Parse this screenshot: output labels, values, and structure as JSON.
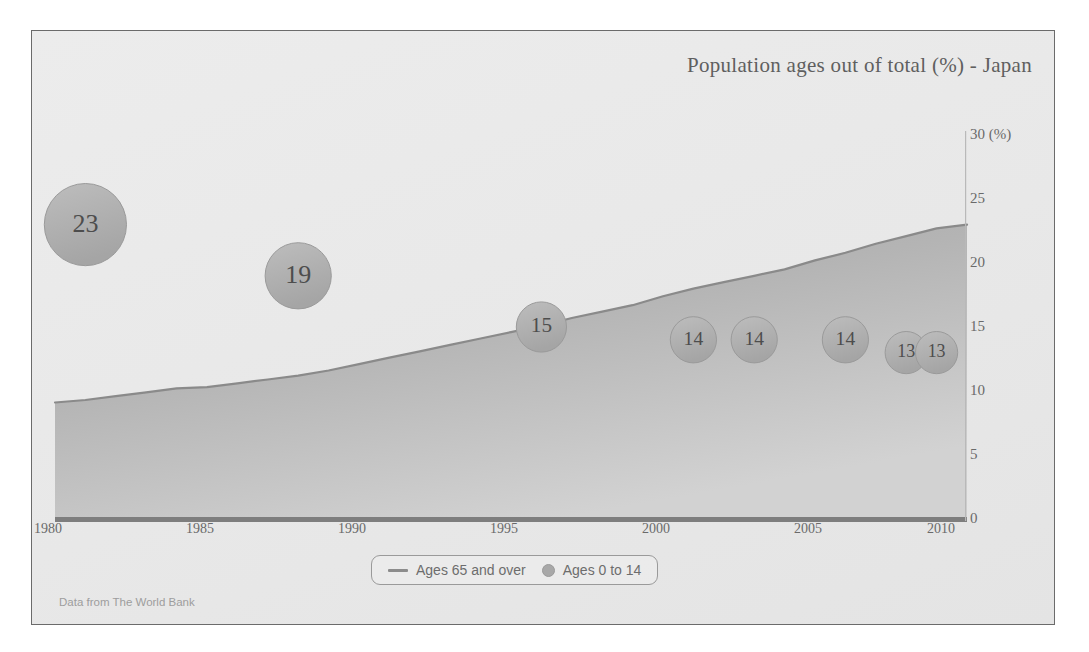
{
  "chart_data": {
    "type": "area",
    "title": "Population ages out of total (%) - Japan",
    "source": "Data from The World Bank",
    "xlabel": "",
    "ylabel": "",
    "yunit": "(%)",
    "xlim": [
      1980,
      2010
    ],
    "ylim": [
      0,
      30
    ],
    "grid": false,
    "legend_position": "bottom-center",
    "x_ticks": [
      "1980",
      "1985",
      "1990",
      "1995",
      "2000",
      "2005",
      "2010"
    ],
    "y_ticks": [
      "0",
      "5",
      "10",
      "15",
      "20",
      "25",
      "30 (%)"
    ],
    "y_tick_values": [
      0,
      5,
      10,
      15,
      20,
      25,
      30
    ],
    "series": [
      {
        "name": "Ages 65 and over",
        "type": "area",
        "x": [
          1980,
          1981,
          1982,
          1983,
          1984,
          1985,
          1986,
          1987,
          1988,
          1989,
          1990,
          1991,
          1992,
          1993,
          1994,
          1995,
          1996,
          1997,
          1998,
          1999,
          2000,
          2001,
          2002,
          2003,
          2004,
          2005,
          2006,
          2007,
          2008,
          2009,
          2010
        ],
        "values": [
          9.1,
          9.3,
          9.6,
          9.9,
          10.2,
          10.3,
          10.6,
          10.9,
          11.2,
          11.6,
          12.1,
          12.6,
          13.1,
          13.6,
          14.1,
          14.6,
          15.1,
          15.7,
          16.2,
          16.7,
          17.4,
          18.0,
          18.5,
          19.0,
          19.5,
          20.2,
          20.8,
          21.5,
          22.1,
          22.7,
          23.0
        ],
        "line_color": "#8c8c8c",
        "fill_color": "#b5b5b5"
      },
      {
        "name": "Ages 0 to 14",
        "type": "bubble",
        "bubbles": [
          {
            "label": "23",
            "x": 1981,
            "value": 23
          },
          {
            "label": "19",
            "x": 1988,
            "value": 19
          },
          {
            "label": "15",
            "x": 1996,
            "value": 15
          },
          {
            "label": "14",
            "x": 2001,
            "value": 14
          },
          {
            "label": "14",
            "x": 2003,
            "value": 14
          },
          {
            "label": "14",
            "x": 2006,
            "value": 14
          },
          {
            "label": "13",
            "x": 2008,
            "value": 13
          },
          {
            "label": "13",
            "x": 2009,
            "value": 13
          }
        ],
        "bubble_color": "#b0b0b0",
        "bubble_border": "#9a9a9a"
      }
    ]
  },
  "legend": {
    "items": [
      {
        "label": "Ages 65 and over",
        "marker": "line-marker"
      },
      {
        "label": "Ages 0 to 14",
        "marker": "dot-marker"
      }
    ]
  },
  "colors": {
    "panel_bg": "#eaeaea",
    "panel_border": "#6b6b6b",
    "axis": "#7a7a7a",
    "text": "#6a6a6a",
    "area_fill": "#b5b5b5",
    "bubble": "#b0b0b0",
    "source_text": "#9d9d9d"
  }
}
